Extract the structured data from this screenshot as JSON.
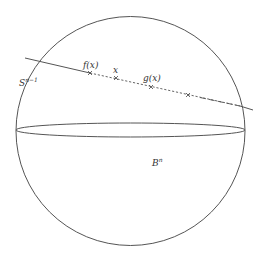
{
  "figure": {
    "colors": {
      "stroke": "#555555",
      "text": "#333333",
      "background": "#ffffff"
    },
    "sphere": {
      "cx": 130.5,
      "cy": 131,
      "r": 114.5
    },
    "equator": {
      "cx": 130.5,
      "cy": 130,
      "rx": 114.5,
      "ry": 7
    },
    "line": {
      "solid_start": [
        25,
        58
      ],
      "solid_end": [
        90,
        73
      ],
      "dashed_end": [
        240,
        106
      ],
      "solid_tail_end": [
        253,
        110
      ]
    },
    "points": [
      {
        "name": "f(x)",
        "x": 90,
        "y": 73
      },
      {
        "name": "x",
        "x": 116,
        "y": 78
      },
      {
        "name": "g(x)",
        "x": 151,
        "y": 87
      },
      {
        "name": "unlabeled",
        "x": 188,
        "y": 95
      }
    ]
  },
  "labels": {
    "sphere_base": "S",
    "sphere_sup": "n−1",
    "ball_base": "B",
    "ball_sup": "n",
    "f_of_x": "f(x)",
    "x": "x",
    "g_of_x": "g(x)"
  }
}
